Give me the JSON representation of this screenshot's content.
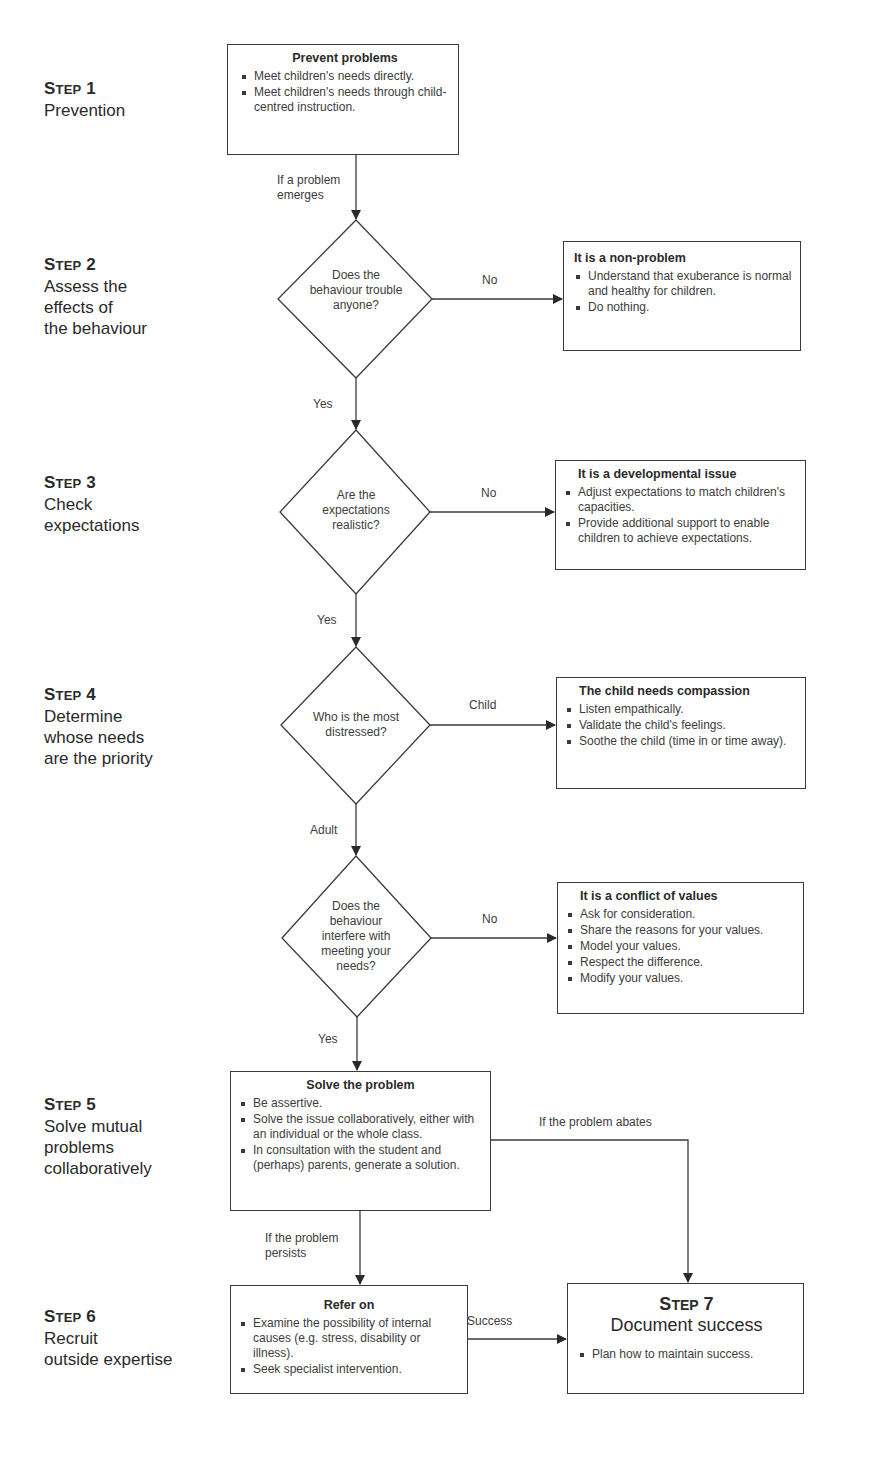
{
  "steps": [
    {
      "number": "Step 1",
      "lines": [
        "Prevention"
      ]
    },
    {
      "number": "Step 2",
      "lines": [
        "Assess the",
        "effects of",
        "the behaviour"
      ]
    },
    {
      "number": "Step 3",
      "lines": [
        "Check",
        "expectations"
      ]
    },
    {
      "number": "Step 4",
      "lines": [
        "Determine",
        "whose needs",
        "are the priority"
      ]
    },
    {
      "number": "Step 5",
      "lines": [
        "Solve mutual",
        "problems",
        "collaboratively"
      ]
    },
    {
      "number": "Step 6",
      "lines": [
        "Recruit",
        "outside expertise"
      ]
    }
  ],
  "boxes": {
    "prevent": {
      "title": "Prevent problems",
      "items": [
        "Meet children's needs directly.",
        "Meet children's needs through child-centred instruction."
      ]
    },
    "non_problem": {
      "title": "It is a non-problem",
      "items": [
        "Understand that exuberance is normal and healthy for children.",
        "Do nothing."
      ]
    },
    "developmental": {
      "title": "It is a developmental issue",
      "items": [
        "Adjust expectations to match children's capacities.",
        "Provide additional support to enable children to achieve expectations."
      ]
    },
    "compassion": {
      "title": "The child needs compassion",
      "items": [
        "Listen empathically.",
        "Validate the child's feelings.",
        "Soothe the child (time in or time away)."
      ]
    },
    "conflict": {
      "title": "It is a conflict of values",
      "items": [
        "Ask for consideration.",
        "Share the reasons for your values.",
        "Model your values.",
        "Respect the difference.",
        "Modify your values."
      ]
    },
    "solve": {
      "title": "Solve the problem",
      "items": [
        "Be assertive.",
        "Solve the issue collaboratively, either with an individual or the whole class.",
        "In consultation with the student and (perhaps) parents, generate a solution."
      ]
    },
    "refer": {
      "title": "Refer on",
      "items": [
        "Examine the possibility of internal causes (e.g. stress, disability or illness).",
        "Seek specialist intervention."
      ]
    },
    "document": {
      "step": "Step 7",
      "title": "Document success",
      "items": [
        "Plan how to maintain success."
      ]
    }
  },
  "decisions": {
    "trouble": "Does the behaviour trouble anyone?",
    "realistic": "Are the expectations realistic?",
    "distressed": "Who is the most distressed?",
    "interfere": "Does the behaviour interfere with meeting your needs?"
  },
  "labels": {
    "emerges": "If a problem emerges",
    "no1": "No",
    "yes1": "Yes",
    "no2": "No",
    "yes2": "Yes",
    "child": "Child",
    "adult": "Adult",
    "no3": "No",
    "yes3": "Yes",
    "abates": "If the problem abates",
    "persists": "If the problem persists",
    "success": "Success"
  }
}
